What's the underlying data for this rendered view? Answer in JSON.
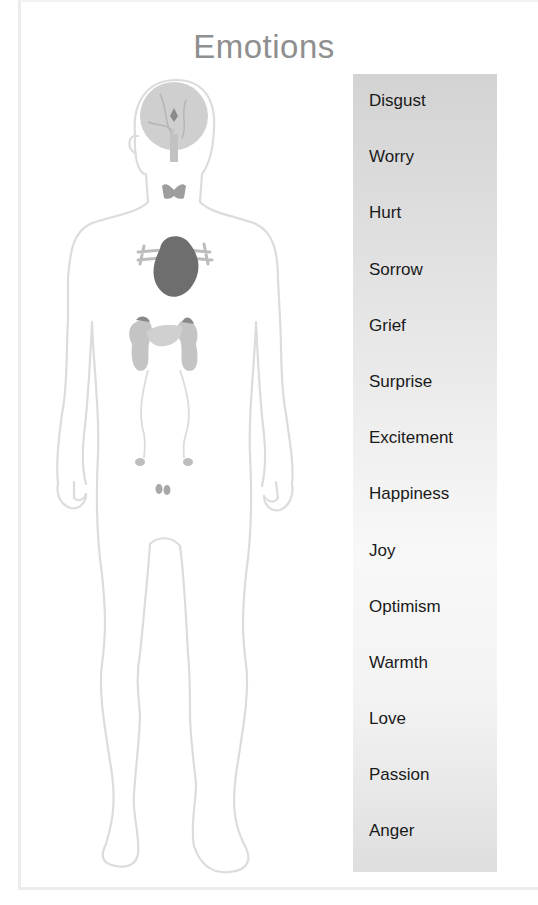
{
  "title": "Emotions",
  "figure": {
    "label": "human-body-outline",
    "organs": [
      "brain",
      "pituitary",
      "thyroid",
      "heart",
      "kidneys",
      "adrenals",
      "pancreas",
      "ovaries",
      "testes"
    ]
  },
  "emotions": [
    {
      "label": "Disgust"
    },
    {
      "label": "Worry"
    },
    {
      "label": "Hurt"
    },
    {
      "label": "Sorrow"
    },
    {
      "label": "Grief"
    },
    {
      "label": "Surprise"
    },
    {
      "label": "Excitement"
    },
    {
      "label": "Happiness"
    },
    {
      "label": "Joy"
    },
    {
      "label": "Optimism"
    },
    {
      "label": "Warmth"
    },
    {
      "label": "Love"
    },
    {
      "label": "Passion"
    },
    {
      "label": "Anger"
    }
  ],
  "colors": {
    "title": "#8f8f8f",
    "outline": "#dcdcdc",
    "organ_light": "#c9c9c9",
    "organ_dark": "#6e6e6e",
    "panel_top": "#d3d3d3",
    "panel_mid": "#f8f8f8"
  }
}
